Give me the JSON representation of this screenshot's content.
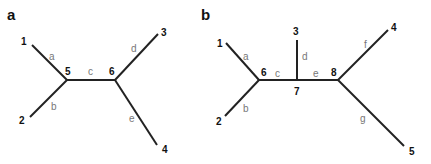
{
  "panels": [
    {
      "label": "a",
      "nodes": [
        {
          "id": "1",
          "label": "1"
        },
        {
          "id": "2",
          "label": "2"
        },
        {
          "id": "3",
          "label": "3"
        },
        {
          "id": "4",
          "label": "4"
        },
        {
          "id": "5",
          "label": "5"
        },
        {
          "id": "6",
          "label": "6"
        }
      ],
      "edges": [
        {
          "label": "a",
          "from": "1",
          "to": "5"
        },
        {
          "label": "b",
          "from": "2",
          "to": "5"
        },
        {
          "label": "c",
          "from": "5",
          "to": "6"
        },
        {
          "label": "d",
          "from": "6",
          "to": "3"
        },
        {
          "label": "e",
          "from": "6",
          "to": "4"
        }
      ]
    },
    {
      "label": "b",
      "nodes": [
        {
          "id": "1",
          "label": "1"
        },
        {
          "id": "2",
          "label": "2"
        },
        {
          "id": "3",
          "label": "3"
        },
        {
          "id": "4",
          "label": "4"
        },
        {
          "id": "5",
          "label": "5"
        },
        {
          "id": "6",
          "label": "6"
        },
        {
          "id": "7",
          "label": "7"
        },
        {
          "id": "8",
          "label": "8"
        }
      ],
      "edges": [
        {
          "label": "a",
          "from": "1",
          "to": "6"
        },
        {
          "label": "b",
          "from": "2",
          "to": "6"
        },
        {
          "label": "c",
          "from": "6",
          "to": "7"
        },
        {
          "label": "d",
          "from": "7",
          "to": "3"
        },
        {
          "label": "e",
          "from": "7",
          "to": "8"
        },
        {
          "label": "f",
          "from": "8",
          "to": "4"
        },
        {
          "label": "g",
          "from": "8",
          "to": "5"
        }
      ]
    }
  ]
}
